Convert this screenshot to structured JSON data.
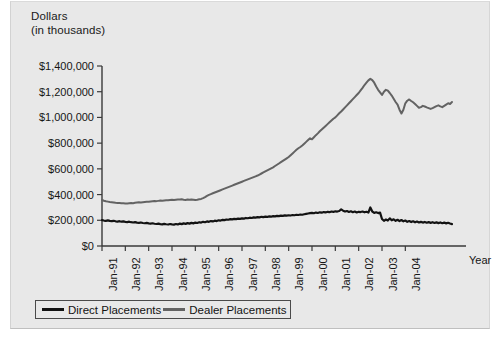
{
  "chart_data": {
    "type": "line",
    "title": "Dollars",
    "subtitle": "(in thousands)",
    "xlabel": "Year",
    "ylabel": "Dollars (in thousands)",
    "ylim": [
      0,
      1400000
    ],
    "ytick_labels": [
      "$1,400,000",
      "$1,200,000",
      "$1,000,000",
      "$800,000",
      "$600,000",
      "$400,000",
      "$200,000",
      "$0"
    ],
    "ytick_values": [
      1400000,
      1200000,
      1000000,
      800000,
      600000,
      400000,
      200000,
      0
    ],
    "xtick_labels": [
      "Jan-91",
      "Jan-92",
      "Jan-93",
      "Jan-94",
      "Jan-95",
      "Jan-96",
      "Jan-97",
      "Jan-98",
      "Jan-99",
      "Jan-00",
      "Jan-01",
      "Jan-02",
      "Jan-03",
      "Jan-04"
    ],
    "grid": false,
    "legend_position": "bottom-left",
    "legend": [
      "Direct Placements",
      "Dealer Placements"
    ],
    "colors": {
      "direct": "#121212",
      "dealer": "#636363",
      "background": "#e8e8e8",
      "axis": "#3a3a3a"
    },
    "x_start": "Jan-91",
    "x_end": "Jan-05",
    "x_step": "monthly",
    "series": [
      {
        "name": "Direct Placements",
        "color": "#121212",
        "values": [
          201000,
          198000,
          196000,
          199000,
          195000,
          193000,
          196000,
          192000,
          190000,
          193000,
          189000,
          191000,
          188000,
          186000,
          189000,
          185000,
          183000,
          186000,
          182000,
          180000,
          183000,
          179000,
          177000,
          180000,
          176000,
          174000,
          177000,
          173000,
          171000,
          174000,
          170000,
          168000,
          172000,
          169000,
          167000,
          171000,
          168000,
          166000,
          171000,
          168000,
          174000,
          170000,
          176000,
          172000,
          178000,
          174000,
          180000,
          176000,
          182000,
          179000,
          185000,
          182000,
          188000,
          185000,
          191000,
          188000,
          194000,
          191000,
          197000,
          194000,
          200000,
          198000,
          203000,
          201000,
          206000,
          204000,
          209000,
          207000,
          211000,
          209000,
          213000,
          211000,
          215000,
          213000,
          218000,
          216000,
          220000,
          218000,
          223000,
          221000,
          225000,
          223000,
          227000,
          225000,
          228000,
          226000,
          230000,
          228000,
          232000,
          230000,
          234000,
          232000,
          236000,
          234000,
          238000,
          236000,
          239000,
          237000,
          241000,
          239000,
          243000,
          241000,
          245000,
          243000,
          247000,
          250000,
          253000,
          256000,
          258000,
          255000,
          260000,
          257000,
          262000,
          259000,
          264000,
          261000,
          266000,
          263000,
          268000,
          265000,
          270000,
          268000,
          272000,
          285000,
          275000,
          268000,
          272000,
          265000,
          270000,
          263000,
          268000,
          261000,
          266000,
          264000,
          268000,
          262000,
          266000,
          260000,
          300000,
          268000,
          258000,
          262000,
          256000,
          260000,
          210000,
          196000,
          206000,
          198000,
          215000,
          200000,
          208000,
          196000,
          204000,
          194000,
          202000,
          192000,
          198000,
          188000,
          194000,
          186000,
          192000,
          184000,
          190000,
          183000,
          188000,
          182000,
          187000,
          181000,
          186000,
          180000,
          185000,
          179000,
          184000,
          178000,
          183000,
          177000,
          182000,
          176000,
          181000,
          175000,
          170000
        ]
      },
      {
        "name": "Dealer Placements",
        "color": "#636363",
        "values": [
          358000,
          352000,
          348000,
          345000,
          342000,
          340000,
          338000,
          336000,
          335000,
          334000,
          333000,
          332000,
          331000,
          330000,
          332000,
          334000,
          333000,
          336000,
          338000,
          340000,
          339000,
          341000,
          343000,
          345000,
          344000,
          346000,
          348000,
          350000,
          349000,
          351000,
          353000,
          352000,
          354000,
          356000,
          355000,
          357000,
          359000,
          358000,
          360000,
          362000,
          361000,
          363000,
          360000,
          358000,
          361000,
          359000,
          362000,
          360000,
          358000,
          360000,
          363000,
          366000,
          372000,
          380000,
          390000,
          398000,
          404000,
          410000,
          416000,
          422000,
          428000,
          434000,
          440000,
          446000,
          452000,
          458000,
          464000,
          470000,
          476000,
          482000,
          488000,
          494000,
          500000,
          506000,
          512000,
          518000,
          524000,
          530000,
          536000,
          542000,
          548000,
          556000,
          564000,
          572000,
          580000,
          588000,
          596000,
          604000,
          612000,
          622000,
          632000,
          642000,
          652000,
          662000,
          672000,
          682000,
          692000,
          706000,
          720000,
          734000,
          748000,
          760000,
          770000,
          782000,
          796000,
          810000,
          824000,
          838000,
          830000,
          846000,
          862000,
          876000,
          892000,
          906000,
          920000,
          934000,
          948000,
          962000,
          976000,
          990000,
          1000000,
          1016000,
          1032000,
          1046000,
          1062000,
          1078000,
          1094000,
          1110000,
          1126000,
          1142000,
          1158000,
          1174000,
          1190000,
          1210000,
          1230000,
          1252000,
          1270000,
          1288000,
          1300000,
          1290000,
          1270000,
          1240000,
          1215000,
          1195000,
          1175000,
          1200000,
          1215000,
          1208000,
          1190000,
          1170000,
          1145000,
          1120000,
          1100000,
          1060000,
          1030000,
          1060000,
          1110000,
          1130000,
          1140000,
          1128000,
          1118000,
          1105000,
          1090000,
          1075000,
          1080000,
          1090000,
          1085000,
          1078000,
          1072000,
          1066000,
          1072000,
          1080000,
          1088000,
          1094000,
          1086000,
          1080000,
          1090000,
          1100000,
          1110000,
          1105000,
          1120000
        ]
      }
    ]
  },
  "legend": {
    "direct_label": "Direct Placements",
    "dealer_label": "Dealer Placements"
  }
}
